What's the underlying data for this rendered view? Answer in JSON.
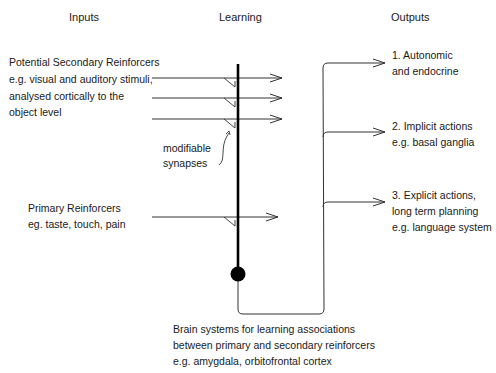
{
  "headers": {
    "inputs": "Inputs",
    "learning": "Learning",
    "outputs": "Outputs"
  },
  "inputs": {
    "secondary": {
      "title": "Potential Secondary Reinforcers",
      "lines": [
        "e.g. visual and auditory stimuli,",
        "analysed cortically to the",
        "object level"
      ]
    },
    "primary": {
      "title": "Primary Reinforcers",
      "lines": [
        "eg. taste, touch, pain"
      ]
    }
  },
  "learning": {
    "synapse_label": [
      "modifiable",
      "synapses"
    ],
    "brain_systems": [
      "Brain systems for learning associations",
      "between primary and secondary reinforcers",
      "e.g. amygdala, orbitofrontal cortex"
    ]
  },
  "outputs": [
    {
      "lines": [
        "1. Autonomic",
        "and endocrine"
      ]
    },
    {
      "lines": [
        "2. Implicit actions",
        "e.g. basal ganglia"
      ]
    },
    {
      "lines": [
        "3. Explicit actions,",
        "long term planning",
        "e.g. language system"
      ]
    }
  ],
  "colors": {
    "line": "#333333",
    "neuron": "#000000"
  }
}
